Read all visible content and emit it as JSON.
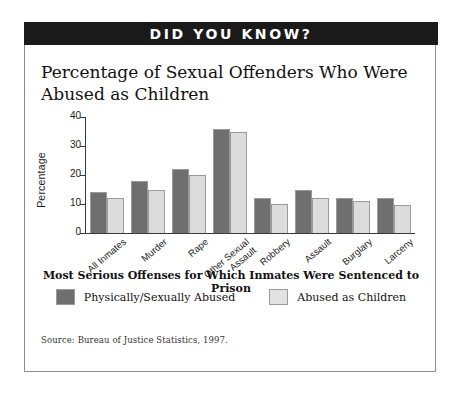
{
  "banner": {
    "text": "DID YOU KNOW?"
  },
  "title": "Percentage of Sexual Offenders Who Were Abused as Children",
  "source": "Source:  Bureau of Justice Statistics, 1997.",
  "chart_data": {
    "type": "bar",
    "title": "Percentage of Sexual Offenders Who Were Abused as Children",
    "xlabel": "Most Serious Offenses for Which Inmates Were Sentenced to Prison",
    "ylabel": "Percentage",
    "ylim": [
      0,
      40
    ],
    "yticks": [
      0,
      10,
      20,
      30,
      40
    ],
    "ytick_labels": [
      "0",
      "10",
      "20",
      "30",
      "40"
    ],
    "grid": false,
    "legend_position": "bottom",
    "categories": [
      "All Inmates",
      "Murder",
      "Rape",
      "Other Sexual\nAssault",
      "Robbery",
      "Assault",
      "Burglary",
      "Larceny"
    ],
    "series": [
      {
        "name": "Physically/Sexually Abused",
        "color": "#6f6f6f",
        "values": [
          14,
          18,
          22,
          36,
          12,
          15,
          12,
          12
        ]
      },
      {
        "name": "Abused as Children",
        "color": "#dcdcdc",
        "values": [
          12,
          15,
          20,
          35,
          10,
          12,
          11,
          9.5
        ]
      }
    ]
  }
}
